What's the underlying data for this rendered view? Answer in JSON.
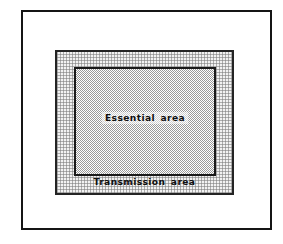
{
  "figure": {
    "type": "nested-area-diagram",
    "background_color": "#ffffff",
    "outer_frame": {
      "name": "picture frame",
      "border_color": "#151515",
      "fill_color": "#ffffff"
    },
    "transmission_area": {
      "label": "Transmission  area",
      "fill": "light stipple",
      "fill_color": "#f2f2f2",
      "border_color": "#242424"
    },
    "essential_area": {
      "label": "Essential  area",
      "fill": "dense checker stipple",
      "fill_color": "#9a9a9a",
      "border_color": "#1a1a1a"
    }
  }
}
